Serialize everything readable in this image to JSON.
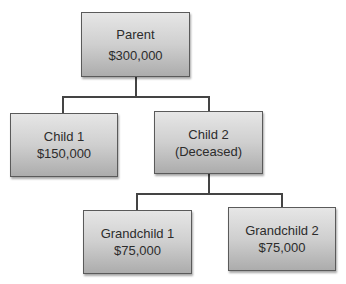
{
  "diagram": {
    "type": "inheritance-tree",
    "nodes": [
      {
        "id": "parent",
        "label": "Parent",
        "value": "$300,000"
      },
      {
        "id": "child1",
        "label": "Child 1",
        "value": "$150,000"
      },
      {
        "id": "child2",
        "label": "Child 2",
        "value": "(Deceased)"
      },
      {
        "id": "grandchild1",
        "label": "Grandchild 1",
        "value": "$75,000"
      },
      {
        "id": "grandchild2",
        "label": "Grandchild 2",
        "value": "$75,000"
      }
    ],
    "edges": [
      {
        "from": "parent",
        "to": "child1"
      },
      {
        "from": "parent",
        "to": "child2"
      },
      {
        "from": "child2",
        "to": "grandchild1"
      },
      {
        "from": "child2",
        "to": "grandchild2"
      }
    ]
  }
}
